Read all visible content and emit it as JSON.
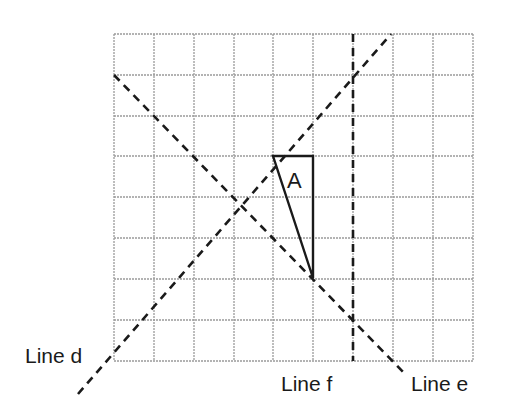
{
  "grid": {
    "columns": 9,
    "rows": 8,
    "origin_px": [
      114,
      34
    ],
    "cell_w": 39.9,
    "cell_h": 40.9,
    "line_color": "#9a9a9a"
  },
  "shape": {
    "label": "A",
    "type": "right-triangle",
    "vertices_grid": [
      [
        4,
        3
      ],
      [
        5,
        3
      ],
      [
        5,
        6
      ]
    ]
  },
  "lines": [
    {
      "id": "d",
      "label": "Line d",
      "style": "dashed",
      "from_grid": [
        -0.9,
        9.0
      ],
      "to_grid": [
        6.93,
        0
      ]
    },
    {
      "id": "e",
      "label": "Line e",
      "style": "dashed",
      "from_grid": [
        0,
        1
      ],
      "to_grid": [
        7.3,
        8.35
      ]
    },
    {
      "id": "f",
      "label": "Line f",
      "style": "dashed",
      "from_grid": [
        6,
        0
      ],
      "to_grid": [
        6,
        8
      ]
    }
  ],
  "labels": {
    "line_d": "Line d",
    "line_e": "Line e",
    "line_f": "Line f",
    "shape_a": "A"
  }
}
